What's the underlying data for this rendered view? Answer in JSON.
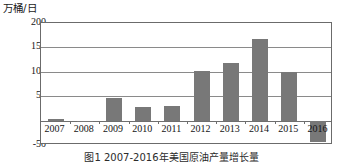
{
  "axis": {
    "y_unit_label": "万桶/日",
    "y_ticks": [
      "200",
      "150",
      "100",
      "50",
      "0",
      "-50"
    ]
  },
  "caption": "图1  2007-2016年美国原油产量增长量",
  "colors": {
    "bar": "#787878",
    "frame": "#6b6b6b",
    "gridline": "#8a8a8a",
    "text": "#141414"
  },
  "chart_data": {
    "type": "bar",
    "title": "",
    "xlabel": "",
    "ylabel": "万桶/日",
    "categories": [
      "2007",
      "2008",
      "2009",
      "2010",
      "2011",
      "2012",
      "2013",
      "2014",
      "2015",
      "2016"
    ],
    "values": [
      3,
      -3,
      47,
      28,
      31,
      102,
      118,
      168,
      100,
      -43
    ],
    "ylim": [
      -50,
      200
    ],
    "ytick_values": [
      200,
      150,
      100,
      50,
      0,
      -50
    ],
    "grid": true,
    "legend": "none"
  }
}
